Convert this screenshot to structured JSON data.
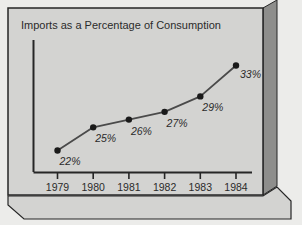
{
  "chart_data": {
    "type": "line",
    "title": "Imports as a Percentage of Consumption",
    "xlabel": "",
    "ylabel": "",
    "categories": [
      "1979",
      "1980",
      "1981",
      "1982",
      "1983",
      "1984"
    ],
    "values": [
      22,
      25,
      26,
      27,
      29,
      33
    ],
    "point_labels": [
      "22%",
      "25%",
      "26%",
      "27%",
      "29%",
      "33%"
    ],
    "ylim": [
      20,
      35
    ],
    "grid": false,
    "legend": "none",
    "axis_style": "L-shaped with downward ticks",
    "marker": "filled-circle",
    "marker_color": "#1a1a1a",
    "line_color": "#4a4a4a",
    "panel_color": "#d3d3d1",
    "border_color": "#262626",
    "shadow_color": "#8e8e8c",
    "bevel_color": "#5a5a58",
    "outer_color": "#ececea"
  },
  "frame": {
    "style_3d": "extruded right edge and bottom base slab"
  }
}
